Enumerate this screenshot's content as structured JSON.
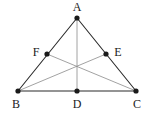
{
  "figure": {
    "type": "geometry-diagram",
    "width": 150,
    "height": 113,
    "background_color": "#ffffff",
    "side_color": "#2b2b2b",
    "cevian_color": "#8a8a8a",
    "point_color": "#1a1a1a",
    "label_color": "#1a1a1a",
    "point_radius": 2.6,
    "side_width": 1.1,
    "cevian_width": 0.8
  },
  "points": [
    {
      "id": "A",
      "label": "A",
      "x": 77,
      "y": 18,
      "label_x": 77,
      "label_y": 7,
      "marked": true
    },
    {
      "id": "B",
      "label": "B",
      "x": 18,
      "y": 91,
      "label_x": 16,
      "label_y": 104,
      "marked": true
    },
    {
      "id": "C",
      "label": "C",
      "x": 136,
      "y": 91,
      "label_x": 137,
      "label_y": 104,
      "marked": true
    },
    {
      "id": "D",
      "label": "D",
      "x": 77,
      "y": 91,
      "label_x": 77,
      "label_y": 104,
      "marked": true
    },
    {
      "id": "E",
      "label": "E",
      "x": 106,
      "y": 54,
      "label_x": 118,
      "label_y": 52,
      "marked": true
    },
    {
      "id": "F",
      "label": "F",
      "x": 47,
      "y": 54,
      "label_x": 36,
      "label_y": 52,
      "marked": true
    }
  ],
  "sides": [
    {
      "id": "AB",
      "from": "A",
      "to": "B",
      "x1": 77,
      "y1": 18,
      "x2": 18,
      "y2": 91
    },
    {
      "id": "AC",
      "from": "A",
      "to": "C",
      "x1": 77,
      "y1": 18,
      "x2": 136,
      "y2": 91
    },
    {
      "id": "BC",
      "from": "B",
      "to": "C",
      "x1": 18,
      "y1": 91,
      "x2": 136,
      "y2": 91
    }
  ],
  "cevians": [
    {
      "id": "AD",
      "from": "A",
      "to": "D",
      "x1": 77,
      "y1": 18,
      "x2": 77,
      "y2": 91
    },
    {
      "id": "BE",
      "from": "B",
      "to": "E",
      "x1": 18,
      "y1": 91,
      "x2": 106,
      "y2": 54
    },
    {
      "id": "CF",
      "from": "C",
      "to": "F",
      "x1": 136,
      "y1": 91,
      "x2": 47,
      "y2": 54
    }
  ]
}
